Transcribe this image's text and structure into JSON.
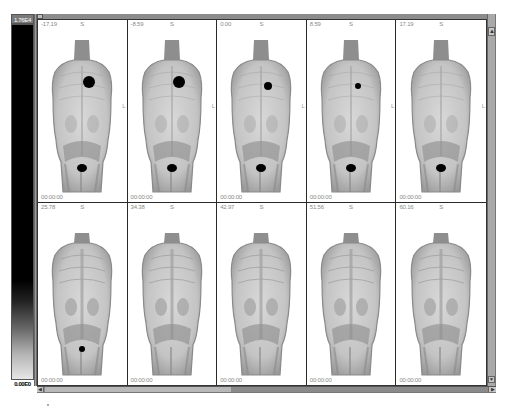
{
  "viewer": {
    "colorbar": {
      "max_label": "1.76E4",
      "min_label": "0.00E0",
      "colormap": "inverted-gray"
    },
    "scroll_up_icon": "▲",
    "scroll_down_icon": "▼",
    "scroll_left_icon": "◀",
    "scroll_right_icon": "▶",
    "horizontal_scroll_position": 0.42,
    "frames": [
      {
        "time": "-17.19",
        "orientation_top": "S",
        "orientation_side": "L",
        "stamp": "00:00:00",
        "row": 1
      },
      {
        "time": "-8.59",
        "orientation_top": "S",
        "orientation_side": "L",
        "stamp": "00:00:00",
        "row": 1
      },
      {
        "time": "0.00",
        "orientation_top": "S",
        "orientation_side": "L",
        "stamp": "00:00:00",
        "row": 1
      },
      {
        "time": "8.59",
        "orientation_top": "S",
        "orientation_side": "L",
        "stamp": "00:00:00",
        "row": 1
      },
      {
        "time": "17.19",
        "orientation_top": "S",
        "orientation_side": "L",
        "stamp": "00:00:00",
        "row": 1
      },
      {
        "time": "25.78",
        "orientation_top": "S",
        "orientation_side": "",
        "stamp": "00:00:00",
        "row": 2
      },
      {
        "time": "34.38",
        "orientation_top": "S",
        "orientation_side": "",
        "stamp": "00:00:00",
        "row": 2
      },
      {
        "time": "42.97",
        "orientation_top": "S",
        "orientation_side": "",
        "stamp": "00:00:00",
        "row": 2
      },
      {
        "time": "51.56",
        "orientation_top": "S",
        "orientation_side": "",
        "stamp": "00:00:00",
        "row": 2
      },
      {
        "time": "60.16",
        "orientation_top": "S",
        "orientation_side": "",
        "stamp": "00:00:00",
        "row": 2
      }
    ]
  }
}
